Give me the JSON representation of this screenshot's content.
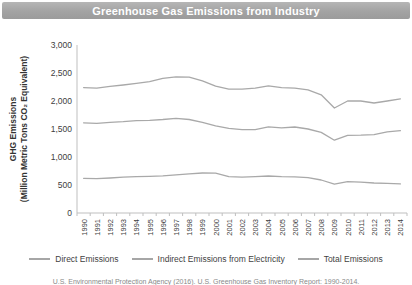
{
  "title": "Greenhouse Gas Emissions from Industry",
  "y_axis": {
    "label_line1": "GHG Emissions",
    "label_line2": "(Million Metric Tons CO₂ Equivalent)",
    "ticks": [
      "0",
      "500",
      "1,000",
      "1,500",
      "2,000",
      "2,500",
      "3,000"
    ]
  },
  "legend": [
    {
      "label": "Direct Emissions"
    },
    {
      "label": "Indirect Emissions from Electricity"
    },
    {
      "label": "Total Emissions"
    }
  ],
  "source": "U.S. Environmental Protection Agency (2016). U.S. Greenhouse Gas Inventory Report: 1990-2014.",
  "colors": {
    "title_bar": "#a6a6a6",
    "series_line": "#a9a9a9",
    "axis": "#bfbfbf",
    "tick_text": "#404040"
  },
  "chart_data": {
    "type": "line",
    "title": "Greenhouse Gas Emissions from Industry",
    "xlabel": "",
    "ylabel": "GHG Emissions (Million Metric Tons CO₂ Equivalent)",
    "ylim": [
      0,
      3000
    ],
    "grid": false,
    "legend_position": "bottom",
    "categories": [
      "1990",
      "1991",
      "1992",
      "1993",
      "1994",
      "1995",
      "1996",
      "1997",
      "1998",
      "1999",
      "2000",
      "2001",
      "2002",
      "2003",
      "2004",
      "2005",
      "2006",
      "2007",
      "2008",
      "2009",
      "2010",
      "2011",
      "2012",
      "2013",
      "2014"
    ],
    "series": [
      {
        "name": "Direct Emissions",
        "values": [
          1610,
          1600,
          1620,
          1630,
          1650,
          1655,
          1670,
          1690,
          1670,
          1620,
          1555,
          1510,
          1490,
          1490,
          1540,
          1520,
          1535,
          1500,
          1440,
          1300,
          1385,
          1390,
          1400,
          1450,
          1470
        ]
      },
      {
        "name": "Indirect Emissions from Electricity",
        "values": [
          620,
          615,
          625,
          640,
          650,
          655,
          665,
          680,
          700,
          715,
          710,
          650,
          640,
          648,
          660,
          650,
          645,
          630,
          590,
          515,
          560,
          550,
          535,
          530,
          520
        ]
      },
      {
        "name": "Total Emissions",
        "values": [
          2240,
          2230,
          2260,
          2285,
          2315,
          2345,
          2405,
          2430,
          2425,
          2360,
          2265,
          2210,
          2210,
          2230,
          2270,
          2240,
          2230,
          2200,
          2110,
          1875,
          2000,
          2000,
          1965,
          2000,
          2040
        ]
      }
    ]
  }
}
